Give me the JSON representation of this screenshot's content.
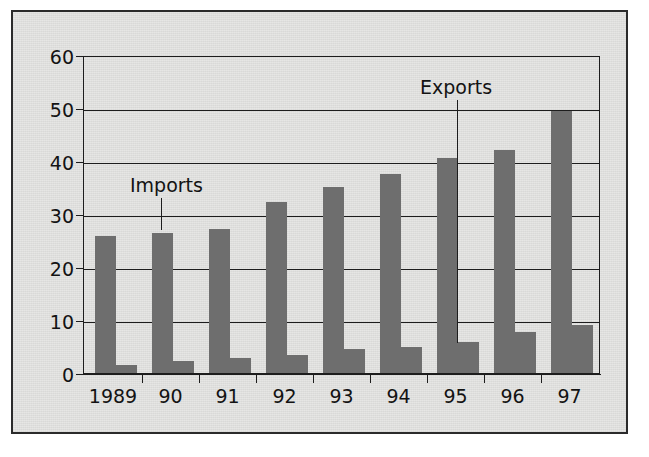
{
  "figure": {
    "background_color": "#ffffff",
    "panel_color": "#e6e6e4",
    "frame_color": "#2b2b2b",
    "bar_color": "#6e6e6e",
    "axis_color": "#1d1d1d"
  },
  "chart_data": {
    "type": "bar",
    "title": "",
    "subtitle": "",
    "xlabel": "",
    "ylabel": "",
    "categories": [
      "1989",
      "90",
      "91",
      "92",
      "93",
      "94",
      "95",
      "96",
      "97"
    ],
    "series": [
      {
        "name": "Imports",
        "values": [
          26.0,
          26.6,
          27.3,
          32.5,
          35.3,
          37.8,
          40.8,
          42.3,
          49.7
        ]
      },
      {
        "name": "Exports",
        "values": [
          1.6,
          2.2,
          2.8,
          3.5,
          4.5,
          5.0,
          5.9,
          7.7,
          9.1
        ]
      }
    ],
    "ylim": [
      0,
      60
    ],
    "yticks": [
      0,
      10,
      20,
      30,
      40,
      50,
      60
    ],
    "ytick_labels": [
      "0",
      "10",
      "20",
      "30",
      "40",
      "50",
      "60"
    ],
    "grid": "horizontal",
    "legend": "annotations",
    "annotations": [
      {
        "text": "Imports",
        "points_to_series": "Imports",
        "points_to_category": "90"
      },
      {
        "text": "Exports",
        "points_to_series": "Exports",
        "points_to_category": "95"
      }
    ]
  },
  "axes": {
    "y_tick_labels": [
      "60",
      "50",
      "40",
      "30",
      "20",
      "10",
      "0"
    ],
    "x_tick_labels": [
      "1989",
      "90",
      "91",
      "92",
      "93",
      "94",
      "95",
      "96",
      "97"
    ]
  },
  "annotations": {
    "imports_label": "Imports",
    "exports_label": "Exports"
  }
}
